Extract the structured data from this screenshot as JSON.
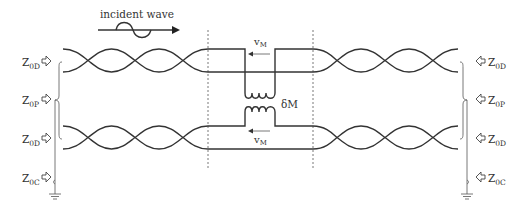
{
  "diagram": {
    "title_label": "incident wave",
    "mutual_inductance_label": "δM",
    "current_label_top": "v",
    "current_label_top_sub": "M",
    "current_label_bottom": "v",
    "current_label_bottom_sub": "M",
    "left_labels": [
      {
        "main": "Z",
        "sub": "0D"
      },
      {
        "main": "Z",
        "sub": "0P"
      },
      {
        "main": "Z",
        "sub": "0D"
      },
      {
        "main": "Z",
        "sub": "0C"
      }
    ],
    "right_labels": [
      {
        "main": "Z",
        "sub": "0D"
      },
      {
        "main": "Z",
        "sub": "0P"
      },
      {
        "main": "Z",
        "sub": "0D"
      },
      {
        "main": "Z",
        "sub": "0C"
      }
    ],
    "colors": {
      "line": "#333333",
      "background": "#ffffff"
    }
  }
}
